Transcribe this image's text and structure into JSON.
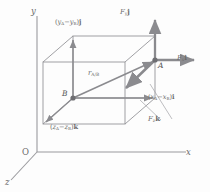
{
  "figure": {
    "kind": "3d-force-position-vector-diagram",
    "axes": {
      "origin_label": "O",
      "y_label": "y",
      "x_label": "x",
      "z_label": "z"
    },
    "points": [
      {
        "name": "A",
        "label": "A"
      },
      {
        "name": "B",
        "label": "B"
      }
    ],
    "vectors": {
      "position": {
        "name": "r_A/B",
        "symbol": "r",
        "subscript": "A/B"
      },
      "force_x": {
        "symbol": "F",
        "subscript": "x",
        "unit_vector": "i"
      },
      "force_y": {
        "symbol": "F",
        "subscript": "y",
        "unit_vector": "j"
      },
      "force_z": {
        "symbol": "F",
        "subscript": "z",
        "unit_vector": "k"
      }
    },
    "edge_components": {
      "y_component": {
        "open": "(",
        "first": "y",
        "first_sub": "A",
        "minus": "−",
        "second": "y",
        "second_sub": "B",
        "close": ")",
        "unit_vector": "j"
      },
      "x_component": {
        "open": "(",
        "first": "x",
        "first_sub": "A",
        "minus": "−",
        "second": "x",
        "second_sub": "B",
        "close": ")",
        "unit_vector": "i"
      },
      "z_component": {
        "open": "(",
        "first": "z",
        "first_sub": "A",
        "minus": "−",
        "second": "z",
        "second_sub": "B",
        "close": ")",
        "unit_vector": "k"
      }
    },
    "colors": {
      "line": "#8f8f93",
      "vector": "#8a8a8e",
      "axis": "#9a9a9e",
      "text": "#5f5f5f",
      "background": "#fdfdfd"
    }
  }
}
